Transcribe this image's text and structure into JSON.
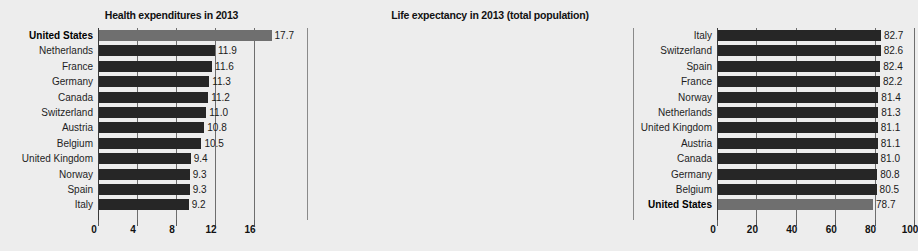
{
  "chart_data": [
    {
      "id": "health-expenditures",
      "type": "bar",
      "orientation": "horizontal",
      "title": "Health expenditures in 2013",
      "xlabel": "",
      "ylabel": "",
      "xlim": [
        0,
        18
      ],
      "xticks": [
        0,
        4,
        8,
        12,
        16
      ],
      "xtick_labels": [
        "0",
        "4",
        "8",
        "12",
        "16"
      ],
      "grid": true,
      "legend": "none",
      "highlight_category": "United States",
      "highlight_color": "#6f6f6f",
      "bar_color": "#262626",
      "categories": [
        "United States",
        "Netherlands",
        "France",
        "Germany",
        "Canada",
        "Switzerland",
        "Austria",
        "Belgium",
        "United Kingdom",
        "Norway",
        "Spain",
        "Italy"
      ],
      "values": [
        17.7,
        11.9,
        11.6,
        11.3,
        11.2,
        11.0,
        10.8,
        10.5,
        9.4,
        9.3,
        9.3,
        9.2
      ],
      "value_labels": [
        "17.7",
        "11.9",
        "11.6",
        "11.3",
        "11.2",
        "11.0",
        "10.8",
        "10.5",
        "9.4",
        "9.3",
        "9.3",
        "9.2"
      ]
    },
    {
      "id": "life-expectancy",
      "type": "bar",
      "orientation": "horizontal",
      "title": "Life expectancy in 2013 (total population)",
      "xlabel": "",
      "ylabel": "",
      "xlim": [
        0,
        105
      ],
      "xticks": [
        0,
        20,
        40,
        60,
        80,
        100
      ],
      "xtick_labels": [
        "0",
        "20",
        "40",
        "60",
        "80",
        "100"
      ],
      "grid": true,
      "legend": "none",
      "highlight_category": "United States",
      "highlight_color": "#6f6f6f",
      "bar_color": "#262626",
      "categories": [
        "Italy",
        "Switzerland",
        "Spain",
        "France",
        "Norway",
        "Netherlands",
        "United Kingdom",
        "Austria",
        "Canada",
        "Germany",
        "Belgium",
        "United States"
      ],
      "values": [
        82.7,
        82.6,
        82.4,
        82.2,
        81.4,
        81.3,
        81.1,
        81.1,
        81.0,
        80.8,
        80.5,
        78.7
      ],
      "value_labels": [
        "82.7",
        "82.6",
        "82.4",
        "82.2",
        "81.4",
        "81.3",
        "81.1",
        "81.1",
        "81.0",
        "80.8",
        "80.5",
        "78.7"
      ]
    }
  ]
}
